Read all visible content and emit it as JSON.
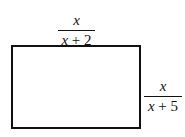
{
  "diagram": {
    "shape": "rectangle",
    "top_label": {
      "numerator": "x",
      "denominator_var": "x",
      "denominator_rest": " + 2"
    },
    "right_label": {
      "numerator": "x",
      "denominator_var": "x",
      "denominator_rest": " + 5"
    },
    "colors": {
      "stroke": "#111111",
      "background": "#ffffff"
    }
  }
}
